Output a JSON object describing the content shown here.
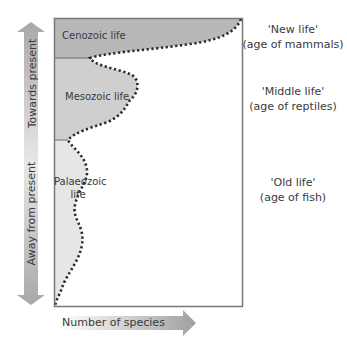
{
  "diagram": {
    "axes": {
      "y_up_label": "Towards present",
      "y_down_label": "Away from present",
      "x_label": "Number of species"
    },
    "regions": [
      {
        "name": "Cenozoic",
        "label": "Cenozoic life",
        "fill": "#b8b8b8"
      },
      {
        "name": "Mesozoic",
        "label": "Mesozoic life",
        "fill": "#cfcfcf"
      },
      {
        "name": "Palaeozoic",
        "label_line1": "Palaeozoic",
        "label_line2": "life",
        "fill": "#e6e6e6"
      }
    ],
    "annotations": [
      {
        "line1": "'New life'",
        "line2": "(age of mammals)"
      },
      {
        "line1": "'Middle life'",
        "line2": "(age of reptiles)"
      },
      {
        "line1": "'Old life'",
        "line2": "(age of fish)"
      }
    ],
    "colors": {
      "frame": "#777777",
      "curve": "#2a2a2a",
      "arrow_dark": "#9a9a9a",
      "arrow_light": "#ececec"
    }
  }
}
